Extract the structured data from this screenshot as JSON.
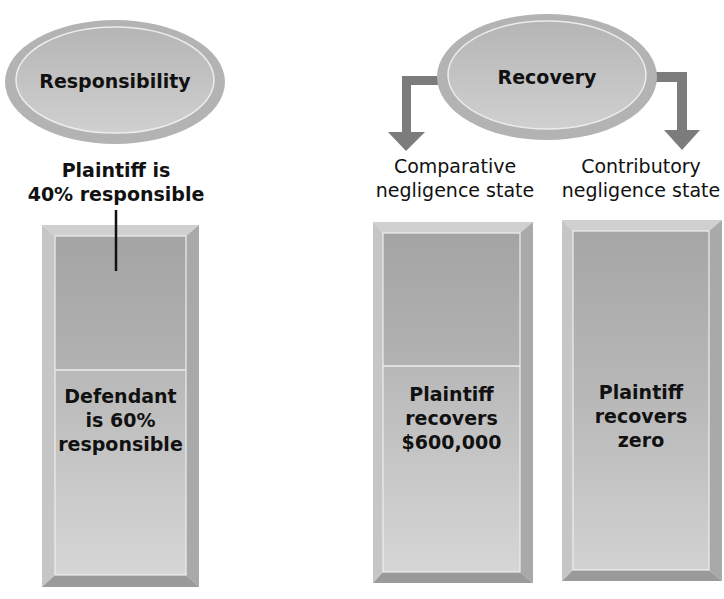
{
  "colors": {
    "background": "#ffffff",
    "ellipse_outer": "#b9b9b9",
    "ellipse_inner": "#c4c4c4",
    "box_bevel_light": "#d2d2d2",
    "box_bevel_dark": "#9a9a9a",
    "box_top_fill": "#aaaaaa",
    "box_bottom_fill": "#c8c8c8",
    "arrow": "#7a7a7a",
    "text": "#111111"
  },
  "responsibility": {
    "title": "Responsibility",
    "plaintiff_caption_line1": "Plaintiff is",
    "plaintiff_caption_line2": "40% responsible",
    "plaintiff_share_percent": 40,
    "defendant_line1": "Defendant",
    "defendant_line2": "is 60%",
    "defendant_line3": "responsible",
    "defendant_share_percent": 60
  },
  "recovery": {
    "title": "Recovery",
    "comparative": {
      "caption_line1": "Comparative",
      "caption_line2": "negligence state",
      "result_line1": "Plaintiff",
      "result_line2": "recovers",
      "result_line3": "$600,000"
    },
    "contributory": {
      "caption_line1": "Contributory",
      "caption_line2": "negligence state",
      "result_line1": "Plaintiff",
      "result_line2": "recovers",
      "result_line3": "zero"
    }
  }
}
